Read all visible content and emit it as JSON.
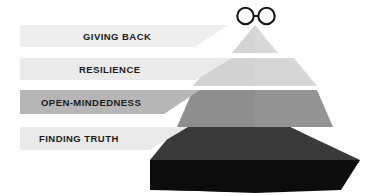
{
  "figure": {
    "type": "pyramid-infographic",
    "title_symbol": "infinity-symbol",
    "background_color": "#ffffff"
  },
  "apex": {
    "icon_name": "infinity-icon",
    "glyph": "∞",
    "color": "#1a1a1a"
  },
  "levels": [
    {
      "rank": 1,
      "position": "top",
      "label": "GIVING BACK",
      "banner_color": "#eeeeee",
      "tier_color": "#d5d5d5",
      "text_color": "#1a1a1a"
    },
    {
      "rank": 2,
      "position": "upper-middle",
      "label": "RESILIENCE",
      "banner_color": "#eaeaea",
      "tier_color": "#d0d0d0",
      "text_color": "#1a1a1a"
    },
    {
      "rank": 3,
      "position": "lower-middle",
      "label": "OPEN-MINDEDNESS",
      "banner_color": "#b6b6b6",
      "tier_color": "#8e8e8e",
      "text_color": "#1a1a1a"
    },
    {
      "rank": 4,
      "position": "base",
      "label": "FINDING TRUTH",
      "banner_color": "#e9e9e9",
      "tier_color": "#0c0c0c",
      "text_color": "#1a1a1a"
    }
  ]
}
